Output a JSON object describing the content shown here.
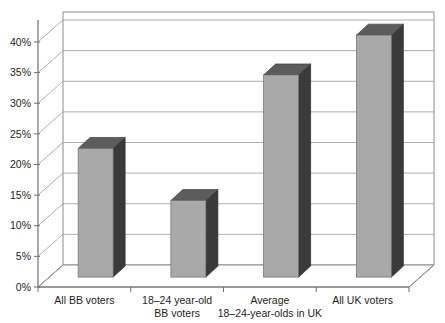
{
  "chart_data": {
    "type": "bar",
    "title": "",
    "subtitle": "",
    "xlabel": "",
    "ylabel": "",
    "categories": [
      "All BB voters",
      "18–24 year-old BB voters",
      "Average 18–24-year-olds in UK",
      "All UK voters"
    ],
    "category_lines": [
      [
        "All BB voters"
      ],
      [
        "18–24 year-old",
        "BB voters"
      ],
      [
        "Average",
        "18–24-year-olds in UK"
      ],
      [
        "All UK voters"
      ]
    ],
    "values": [
      21,
      12.5,
      33,
      39.5
    ],
    "value_labels": [
      "21%",
      "12.5%",
      "33%",
      "39.5%"
    ],
    "ylim": [
      0,
      42
    ],
    "ytick_values": [
      0,
      5,
      10,
      15,
      20,
      25,
      30,
      35,
      40
    ],
    "ytick_labels": [
      "0%",
      "5%",
      "10%",
      "15%",
      "20%",
      "25%",
      "30%",
      "35%",
      "40%"
    ],
    "grid": true,
    "grid_axis": "y",
    "legend": false,
    "legend_position": "none",
    "style": "3d-column",
    "colors": {
      "bar_front": "#a9a9a9",
      "bar_side": "#3a3a3a",
      "bar_top": "#5c5c5c",
      "gridline": "#9a9a9a",
      "axis": "#6f6f6f",
      "text": "#231f20",
      "background": "#ffffff"
    }
  }
}
